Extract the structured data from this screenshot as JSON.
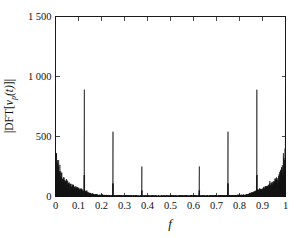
{
  "figure": {
    "background_color": "#ffffff",
    "line_color": "#141414",
    "axis_color": "#1a1a1a"
  },
  "chart_data": {
    "type": "line",
    "title": "",
    "subtitle": "",
    "xlabel": "f",
    "ylabel": "|DFT[ν_p(t)]|",
    "ylabel_parts": {
      "bar_open": "|DFT[",
      "nu": "ν",
      "subscript": "p",
      "arg": "(t)",
      "bar_close": "]|"
    },
    "xlim": [
      0,
      1
    ],
    "ylim": [
      0,
      1500
    ],
    "grid": false,
    "legend": null,
    "x_tick_values": [
      0,
      0.1,
      0.2,
      0.3,
      0.4,
      0.5,
      0.6,
      0.7,
      0.8,
      0.9,
      1
    ],
    "x_tick_labels": [
      "0",
      "0.1",
      "0.2",
      "0.3",
      "0.4",
      "0.5",
      "0.6",
      "0.7",
      "0.8",
      "0.9",
      "1"
    ],
    "y_tick_values": [
      0,
      500,
      1000,
      1500
    ],
    "y_tick_labels": [
      "0",
      "500",
      "1 000",
      "1 500"
    ],
    "peaks": [
      {
        "f": 0.0,
        "amplitude": 930
      },
      {
        "f": 0.125,
        "amplitude": 890
      },
      {
        "f": 0.25,
        "amplitude": 540
      },
      {
        "f": 0.375,
        "amplitude": 250
      },
      {
        "f": 0.625,
        "amplitude": 250
      },
      {
        "f": 0.75,
        "amplitude": 540
      },
      {
        "f": 0.875,
        "amplitude": 890
      },
      {
        "f": 1.0,
        "amplitude": 930
      }
    ],
    "noise_floor_description": "Broadband noise skirt decaying from ~430 near f=0 to near 0 by f≈0.18, flat near 0 through mid-band, rising again from f≈0.82 to ~430 at f=1",
    "noise_envelope": [
      {
        "f": 0.0,
        "level": 430
      },
      {
        "f": 0.01,
        "level": 300
      },
      {
        "f": 0.02,
        "level": 225
      },
      {
        "f": 0.03,
        "level": 185
      },
      {
        "f": 0.045,
        "level": 150
      },
      {
        "f": 0.06,
        "level": 120
      },
      {
        "f": 0.08,
        "level": 95
      },
      {
        "f": 0.1,
        "level": 75
      },
      {
        "f": 0.12,
        "level": 60
      },
      {
        "f": 0.14,
        "level": 40
      },
      {
        "f": 0.16,
        "level": 25
      },
      {
        "f": 0.18,
        "level": 16
      },
      {
        "f": 0.22,
        "level": 12
      },
      {
        "f": 0.3,
        "level": 10
      },
      {
        "f": 0.4,
        "level": 9
      },
      {
        "f": 0.5,
        "level": 9
      },
      {
        "f": 0.6,
        "level": 9
      },
      {
        "f": 0.7,
        "level": 10
      },
      {
        "f": 0.78,
        "level": 12
      },
      {
        "f": 0.82,
        "level": 16
      },
      {
        "f": 0.84,
        "level": 25
      },
      {
        "f": 0.86,
        "level": 40
      },
      {
        "f": 0.88,
        "level": 60
      },
      {
        "f": 0.9,
        "level": 75
      },
      {
        "f": 0.92,
        "level": 95
      },
      {
        "f": 0.94,
        "level": 120
      },
      {
        "f": 0.955,
        "level": 150
      },
      {
        "f": 0.97,
        "level": 185
      },
      {
        "f": 0.98,
        "level": 225
      },
      {
        "f": 0.99,
        "level": 300
      },
      {
        "f": 1.0,
        "level": 430
      }
    ]
  }
}
